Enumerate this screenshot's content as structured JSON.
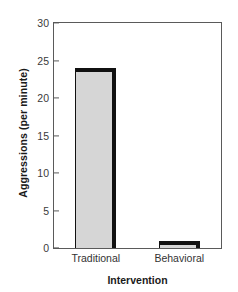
{
  "chart_data": {
    "type": "bar",
    "title": "",
    "xlabel": "Intervention",
    "ylabel": "Aggressions (per minute)",
    "categories": [
      "Traditional",
      "Behavioral"
    ],
    "values": [
      24,
      1
    ],
    "ylim": [
      0,
      30
    ],
    "yticks": [
      0,
      5,
      10,
      15,
      20,
      25,
      30
    ],
    "ytick_labels": [
      "0",
      "5",
      "10",
      "15",
      "20",
      "25",
      "30"
    ],
    "grid": false,
    "legend": null,
    "series": [
      {
        "name": "Aggressions (per minute)",
        "values": [
          24,
          1
        ]
      }
    ],
    "colors": {
      "bar_fill": "#d6d6d6",
      "bar_edge": "#111111",
      "axis": "#5a5a5a",
      "text": "#1a1a1a",
      "background": "#ffffff"
    }
  }
}
